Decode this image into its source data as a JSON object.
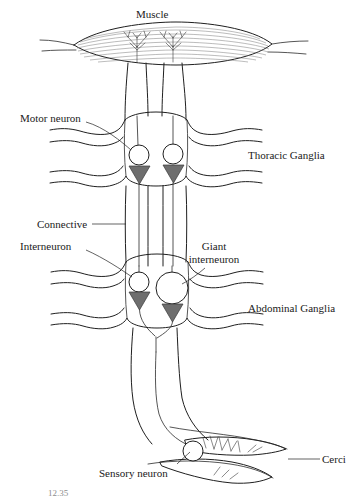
{
  "figure": {
    "caption_number": "12.35",
    "colors": {
      "ink": "#1f1f1f",
      "soma_fill": "#ffffff",
      "synapse_fill": "#6e6e6e",
      "synapse_stroke": "#3a3a3a",
      "muscle_striation": "#6a6a6a",
      "background": "#ffffff"
    }
  },
  "labels": {
    "muscle": "Muscle",
    "motor_neuron": "Motor neuron",
    "thoracic_ganglia": "Thoracic Ganglia",
    "connective": "Connective",
    "interneuron": "Interneuron",
    "giant_interneuron_line1": "Giant",
    "giant_interneuron_line2": "interneuron",
    "abdominal_ganglia": "Abdominal Ganglia",
    "sensory_neuron": "Sensory neuron",
    "cerci": "Cerci"
  },
  "structures": [
    {
      "name": "muscle",
      "type": "effector",
      "label": "Muscle",
      "note": "striated lens-shaped muscle at top with two neuromuscular junction arborizations"
    },
    {
      "name": "motor-neuron",
      "type": "neuron",
      "label": "Motor neuron",
      "soma_shape": "circle",
      "soma_size": "small",
      "count": 2,
      "ganglion": "thoracic"
    },
    {
      "name": "thoracic-ganglion",
      "type": "ganglion",
      "label": "Thoracic Ganglia",
      "lateral_nerve_pairs": 2
    },
    {
      "name": "connective",
      "type": "tract",
      "label": "Connective",
      "note": "paired longitudinal nerve cord linking thoracic and abdominal ganglia"
    },
    {
      "name": "interneuron",
      "type": "neuron",
      "label": "Interneuron",
      "soma_shape": "circle",
      "soma_size": "small",
      "ganglion": "abdominal"
    },
    {
      "name": "giant-interneuron",
      "type": "neuron",
      "label": "Giant interneuron",
      "soma_shape": "circle",
      "soma_size": "large",
      "ganglion": "abdominal"
    },
    {
      "name": "abdominal-ganglion",
      "type": "ganglion",
      "label": "Abdominal Ganglia",
      "lateral_nerve_pairs": 2
    },
    {
      "name": "sensory-neuron",
      "type": "neuron",
      "label": "Sensory neuron",
      "soma_shape": "circle",
      "soma_size": "small",
      "location": "cercus base"
    },
    {
      "name": "cerci",
      "type": "sensory-appendage",
      "label": "Cerci",
      "count": 2,
      "note": "tapered appendages bearing mechanosensory bristles"
    }
  ],
  "synapses": [
    {
      "name": "motor-synapse-left",
      "shape": "triangle",
      "orientation": "down",
      "ganglion": "thoracic"
    },
    {
      "name": "motor-synapse-right",
      "shape": "triangle",
      "orientation": "down",
      "ganglion": "thoracic"
    },
    {
      "name": "interneuron-synapse",
      "shape": "triangle",
      "orientation": "down",
      "ganglion": "abdominal"
    },
    {
      "name": "giant-interneuron-synapse",
      "shape": "triangle",
      "orientation": "down",
      "ganglion": "abdominal"
    }
  ],
  "signal_path": [
    "Cerci (wind-sensitive bristles)",
    "Sensory neuron",
    "Giant interneuron",
    "Interneuron",
    "Connective",
    "Motor neuron",
    "Muscle"
  ]
}
